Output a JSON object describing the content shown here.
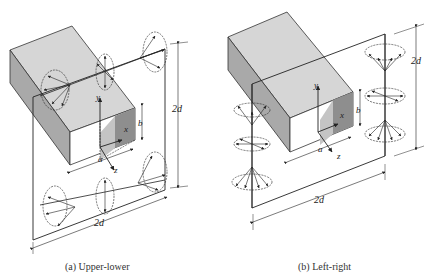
{
  "figure": {
    "panels": [
      {
        "id": "a",
        "caption": "(a)  Upper-lower",
        "labels": {
          "y": "y",
          "x": "x",
          "z": "z",
          "a": "a",
          "b": "b",
          "height": "2d",
          "width": "2d"
        }
      },
      {
        "id": "b",
        "caption": "(b)  Left-right",
        "labels": {
          "y": "y",
          "x": "x",
          "z": "z",
          "a": "a",
          "b": "b",
          "height": "2d",
          "width": "2d"
        }
      }
    ],
    "colors": {
      "box_top": "#d6d6d6",
      "box_side": "#a9a9a9",
      "box_front_inner": "#8e8e8e",
      "line": "#222222"
    }
  }
}
